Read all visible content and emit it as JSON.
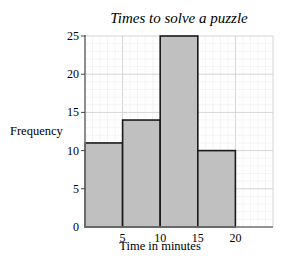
{
  "chart_data": {
    "type": "bar",
    "subtype": "histogram",
    "title": "Times to solve a puzzle",
    "xlabel": "Time in minutes",
    "ylabel": "Frequency",
    "bins": [
      [
        0,
        5
      ],
      [
        5,
        10
      ],
      [
        10,
        15
      ],
      [
        15,
        20
      ]
    ],
    "categories": [
      "0-5",
      "5-10",
      "10-15",
      "15-20"
    ],
    "values": [
      11,
      14,
      25,
      10
    ],
    "x_ticks": [
      0,
      5,
      10,
      15,
      20
    ],
    "y_ticks": [
      0,
      5,
      10,
      15,
      20,
      25
    ],
    "xlim": [
      0,
      25
    ],
    "ylim": [
      0,
      25
    ],
    "grid": true,
    "legend": null,
    "bar_color": "#c0c0c0",
    "bar_edge_color": "#1a1a1a"
  }
}
